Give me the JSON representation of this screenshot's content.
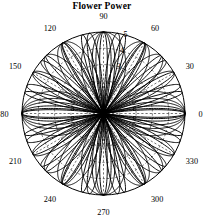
{
  "figure": {
    "title": "Flower Power",
    "background_color": "#ffffff",
    "line_color": "#000000",
    "grid_color": "#000000",
    "width": 204,
    "height": 215
  },
  "chart_data": {
    "type": "line",
    "plot_style": "polar",
    "title": "Flower Power",
    "xlabel": "",
    "ylabel": "",
    "angle_unit": "degrees",
    "theta_ticks": [
      0,
      30,
      60,
      90,
      120,
      150,
      180,
      210,
      240,
      270,
      300,
      330
    ],
    "theta_tick_labels": [
      "0",
      "30",
      "60",
      "90",
      "120",
      "150",
      "180",
      "210",
      "240",
      "270",
      "300",
      "330"
    ],
    "radial_ticks": [
      1,
      2,
      3,
      4,
      5
    ],
    "radial_tick_labels_visible": [
      "3",
      "4",
      "5"
    ],
    "rlim": [
      0,
      5
    ],
    "grid": true,
    "grid_linestyle": "dotted",
    "legend": false,
    "legend_position": "none",
    "series": [
      {
        "name": "rose-k2",
        "petals": 4,
        "amplitude": 5,
        "phase_deg": 0
      },
      {
        "name": "rose-k3",
        "petals": 6,
        "amplitude": 5,
        "phase_deg": 0
      },
      {
        "name": "rose-k4",
        "petals": 8,
        "amplitude": 5,
        "phase_deg": 0
      },
      {
        "name": "rose-k6",
        "petals": 12,
        "amplitude": 5,
        "phase_deg": 0
      },
      {
        "name": "rose-k9",
        "petals": 18,
        "amplitude": 5,
        "phase_deg": 0
      },
      {
        "name": "rose-k12",
        "petals": 24,
        "amplitude": 5,
        "phase_deg": 0
      }
    ]
  },
  "angle_labels": [
    {
      "value": "0",
      "deg": 0
    },
    {
      "value": "30",
      "deg": 30
    },
    {
      "value": "60",
      "deg": 60
    },
    {
      "value": "90",
      "deg": 90
    },
    {
      "value": "120",
      "deg": 120
    },
    {
      "value": "150",
      "deg": 150
    },
    {
      "value": "180",
      "deg": 180
    },
    {
      "value": "210",
      "deg": 210
    },
    {
      "value": "240",
      "deg": 240
    },
    {
      "value": "270",
      "deg": 270
    },
    {
      "value": "300",
      "deg": 300
    },
    {
      "value": "330",
      "deg": 330
    }
  ],
  "radial_labels": [
    {
      "value": "3",
      "r": 3
    },
    {
      "value": "4",
      "r": 4
    },
    {
      "value": "5",
      "r": 5
    }
  ]
}
